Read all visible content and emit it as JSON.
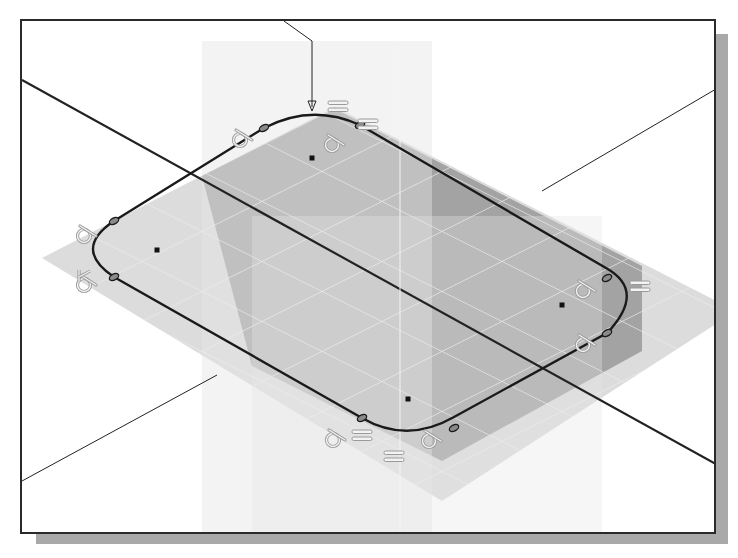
{
  "figure": {
    "colors": {
      "background": "#ffffff",
      "frame": "#2a2a2a",
      "shadow": "#a9a9a9",
      "plane_dark": "#9c9c9c",
      "plane_light": "#d6d6d6",
      "plane_vertical": "#e4e4e4",
      "grid": "#ededed",
      "sketch_line": "#1a1a1a",
      "axis_line": "#222222",
      "constraint_glyph": "#c8c8c8"
    }
  },
  "viewport": {
    "datum_planes": [
      {
        "name": "horizontal-plane-light",
        "points": "20,237 313,86 714,290 420,480"
      },
      {
        "name": "horizontal-plane-dark",
        "points": "180,155 313,88 620,245 620,330 420,440 230,345"
      },
      {
        "name": "vertical-plane-left",
        "points": "180,20 410,20 410,545 180,545"
      },
      {
        "name": "vertical-plane-right",
        "points": "230,195 580,195 580,545 230,545"
      }
    ],
    "axes": [
      {
        "name": "primary-axis",
        "x1": 0,
        "y1": 59,
        "x2": 694,
        "y2": 443,
        "width": 2.2
      },
      {
        "name": "leader-top",
        "path": "M 262 0 L 290 20 L 290 86"
      },
      {
        "name": "axis-upper-right",
        "x1": 520,
        "y1": 170,
        "x2": 694,
        "y2": 68,
        "width": 1
      },
      {
        "name": "axis-lower-left",
        "x1": 0,
        "y1": 460,
        "x2": 195,
        "y2": 354,
        "width": 1
      },
      {
        "name": "vertical-axis",
        "x1": 378,
        "y1": 20,
        "x2": 378,
        "y2": 511,
        "width": 1
      }
    ],
    "sketch_profile": {
      "name": "rounded-rectangle",
      "path": "M 242 107 Q 290 82 338 104 L 584 247 Q 625 270 585 312 L 432 396 Q 385 423 340 397 L 92 256 Q 50 228 92 200 Z"
    },
    "center_points": [
      {
        "x": 290,
        "y": 137
      },
      {
        "x": 135,
        "y": 229
      },
      {
        "x": 540,
        "y": 284
      },
      {
        "x": 386,
        "y": 378
      }
    ],
    "tangent_markers": [
      {
        "x": 242,
        "y": 107
      },
      {
        "x": 338,
        "y": 104
      },
      {
        "x": 92,
        "y": 200
      },
      {
        "x": 92,
        "y": 256
      },
      {
        "x": 585,
        "y": 257
      },
      {
        "x": 585,
        "y": 312
      },
      {
        "x": 340,
        "y": 397
      },
      {
        "x": 432,
        "y": 407
      }
    ],
    "constraints": [
      {
        "type": "tangent",
        "symbol": "tangent-glyph",
        "x": 210,
        "y": 108
      },
      {
        "type": "tangent",
        "symbol": "tangent-glyph",
        "x": 302,
        "y": 113
      },
      {
        "type": "equal",
        "symbol": "=",
        "x": 306,
        "y": 80
      },
      {
        "type": "equal",
        "symbol": "=",
        "x": 336,
        "y": 98
      },
      {
        "type": "tangent",
        "symbol": "tangent-glyph",
        "x": 54,
        "y": 204
      },
      {
        "type": "fix",
        "symbol": "fix-glyph",
        "x": 54,
        "y": 253
      },
      {
        "type": "tangent",
        "symbol": "tangent-glyph",
        "x": 553,
        "y": 259
      },
      {
        "type": "equal",
        "symbol": "=",
        "x": 608,
        "y": 260
      },
      {
        "type": "tangent",
        "symbol": "tangent-glyph",
        "x": 553,
        "y": 313
      },
      {
        "type": "tangent",
        "symbol": "tangent-glyph",
        "x": 303,
        "y": 408
      },
      {
        "type": "equal",
        "symbol": "=",
        "x": 330,
        "y": 409
      },
      {
        "type": "equal",
        "symbol": "=",
        "x": 362,
        "y": 430
      },
      {
        "type": "tangent",
        "symbol": "tangent-glyph",
        "x": 399,
        "y": 409
      }
    ]
  }
}
